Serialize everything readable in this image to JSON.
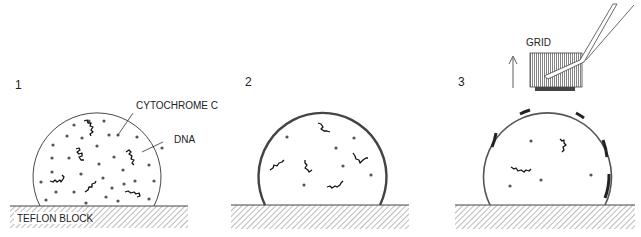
{
  "panels": [
    {
      "number": "1",
      "labels": {
        "cytochrome": "CYTOCHROME C",
        "dna": "DNA",
        "block": "TEFLON BLOCK"
      }
    },
    {
      "number": "2"
    },
    {
      "number": "3",
      "labels": {
        "grid": "GRID"
      }
    }
  ],
  "colors": {
    "line": "#333333",
    "dot": "#555555",
    "film": "#444444",
    "hatch": "#666666"
  }
}
